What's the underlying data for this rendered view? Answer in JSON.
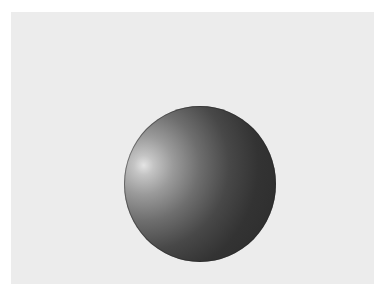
{
  "scene": {
    "background_color": "#ffffff",
    "panel_color": "#ececec",
    "object": {
      "type": "sphere",
      "highlight_color": "#e4e4e4",
      "shadow_color": "#2a2a2a",
      "light_direction": "upper-left"
    }
  }
}
